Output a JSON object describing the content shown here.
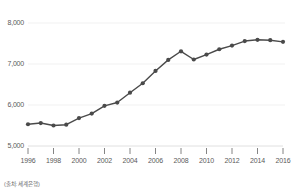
{
  "chart_data": {
    "type": "line",
    "title": "",
    "subtitle": "",
    "xlabel": "",
    "ylabel": "",
    "xlim": [
      1996,
      2016
    ],
    "ylim": [
      5000,
      8000
    ],
    "grid": true,
    "legend_position": "none",
    "line_color": "#4a4a4a",
    "marker_color": "#4a4a4a",
    "marker": "circle",
    "gridline_color": "#eeeeee",
    "y_ticks": [
      5000,
      6000,
      7000,
      8000
    ],
    "y_tick_labels": [
      "5,000",
      "6,000",
      "7,000",
      "8,000"
    ],
    "x_ticks": [
      1996,
      1998,
      2000,
      2002,
      2004,
      2006,
      2008,
      2010,
      2012,
      2014,
      2016
    ],
    "x_tick_labels": [
      "1996",
      "1998",
      "2000",
      "2002",
      "2004",
      "2006",
      "2008",
      "2010",
      "2012",
      "2014",
      "2016"
    ],
    "x": [
      1996,
      1997,
      1998,
      1999,
      2000,
      2001,
      2002,
      2003,
      2004,
      2005,
      2006,
      2007,
      2008,
      2009,
      2010,
      2011,
      2012,
      2013,
      2014,
      2015,
      2016
    ],
    "values": [
      5530,
      5560,
      5500,
      5520,
      5680,
      5790,
      5980,
      6060,
      6300,
      6530,
      6830,
      7100,
      7310,
      7110,
      7230,
      7360,
      7450,
      7560,
      7590,
      7580,
      7540
    ],
    "series": [
      {
        "name": "series-1",
        "values": [
          5530,
          5560,
          5500,
          5520,
          5680,
          5790,
          5980,
          6060,
          6300,
          6530,
          6830,
          7100,
          7310,
          7110,
          7230,
          7360,
          7450,
          7560,
          7590,
          7580,
          7540
        ]
      }
    ],
    "annotations": []
  },
  "footer": {
    "source_note": "(출처: 세계은행)"
  }
}
